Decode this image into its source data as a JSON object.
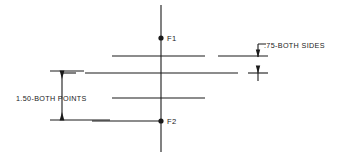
{
  "drawing": {
    "type": "engineering-dimension-diagram",
    "background_color": "#ffffff",
    "line_color": "#1a1a1a",
    "width": 356,
    "height": 158,
    "points": [
      {
        "id": "F1",
        "label": "F1",
        "x": 161,
        "y": 38
      },
      {
        "id": "F2",
        "label": "F2",
        "x": 161,
        "y": 121
      }
    ],
    "dimensions": [
      {
        "id": "vertical-dim-left",
        "label": "1.50-BOTH POINTS",
        "value": "1.50",
        "note": "BOTH POINTS",
        "orientation": "vertical",
        "text_x": 16,
        "text_y": 101,
        "line_x": 62,
        "from_y": 71,
        "to_y": 120
      },
      {
        "id": "leader-dim-right",
        "label": ".75-BOTH SIDES",
        "value": ".75",
        "note": "BOTH SIDES",
        "orientation": "leader",
        "text_x": 264,
        "text_y": 48,
        "leader_x": 258,
        "from_y": 44,
        "to_y": 57
      }
    ],
    "centerline": {
      "id": "vertical-centerline",
      "x": 161,
      "y1": 5,
      "y2": 152
    },
    "horizontal_lines": [
      {
        "id": "line-1",
        "y": 56,
        "x1": 112,
        "x2": 205
      },
      {
        "id": "line-1-dash",
        "y": 56,
        "x1": 218,
        "x2": 268
      },
      {
        "id": "line-2",
        "y": 73,
        "x1": 85,
        "x2": 238
      },
      {
        "id": "line-2-dash-left",
        "y": 73,
        "x1": 62,
        "x2": 76
      },
      {
        "id": "line-2-dash-right",
        "y": 73,
        "x1": 248,
        "x2": 268
      },
      {
        "id": "line-3",
        "y": 98,
        "x1": 112,
        "x2": 205
      },
      {
        "id": "line-4",
        "y": 121,
        "x1": 92,
        "x2": 161
      }
    ],
    "tick_marks": [
      {
        "id": "tick-upper-right",
        "x": 258,
        "y1": 44,
        "y2": 57
      },
      {
        "id": "tick-lower-right",
        "x": 258,
        "y1": 67,
        "y2": 81
      }
    ]
  }
}
